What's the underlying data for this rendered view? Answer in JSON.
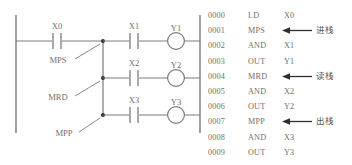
{
  "diagram": {
    "type": "plc-ladder-and-instruction-list",
    "ladder": {
      "left_rail_label": "",
      "contacts": [
        {
          "id": "x0",
          "label": "X0"
        },
        {
          "id": "x1",
          "label": "X1"
        },
        {
          "id": "x2",
          "label": "X2"
        },
        {
          "id": "x3",
          "label": "X3"
        }
      ],
      "coils": [
        {
          "id": "y1",
          "label": "Y1"
        },
        {
          "id": "y2",
          "label": "Y2"
        },
        {
          "id": "y3",
          "label": "Y3"
        }
      ],
      "stack_markers": [
        {
          "id": "mps",
          "label": "MPS"
        },
        {
          "id": "mrd",
          "label": "MRD"
        },
        {
          "id": "mpp",
          "label": "MPP"
        }
      ]
    },
    "instruction_list": {
      "rows": [
        {
          "addr": "0000",
          "mnemonic": "LD",
          "operand": "X0",
          "note": ""
        },
        {
          "addr": "0001",
          "mnemonic": "MPS",
          "operand": "",
          "note": "进栈"
        },
        {
          "addr": "0002",
          "mnemonic": "AND",
          "operand": "X1",
          "note": ""
        },
        {
          "addr": "0003",
          "mnemonic": "OUT",
          "operand": "Y1",
          "note": ""
        },
        {
          "addr": "0004",
          "mnemonic": "MRD",
          "operand": "",
          "note": "读栈"
        },
        {
          "addr": "0005",
          "mnemonic": "AND",
          "operand": "X2",
          "note": ""
        },
        {
          "addr": "0006",
          "mnemonic": "OUT",
          "operand": "Y2",
          "note": ""
        },
        {
          "addr": "0007",
          "mnemonic": "MPP",
          "operand": "",
          "note": "出栈"
        },
        {
          "addr": "0008",
          "mnemonic": "AND",
          "operand": "X3",
          "note": ""
        },
        {
          "addr": "0009",
          "mnemonic": "OUT",
          "operand": "Y3",
          "note": ""
        }
      ]
    },
    "colors": {
      "line": "#7a7a7a",
      "text": "#6f6f6f",
      "note_text": "#555555",
      "background": "#ffffff"
    }
  }
}
